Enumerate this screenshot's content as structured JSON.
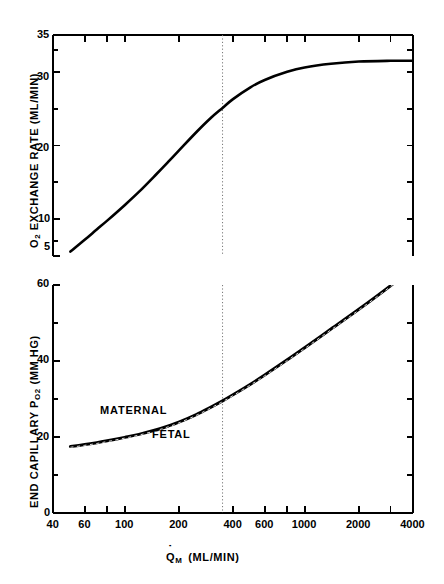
{
  "figure": {
    "background_color": "#ffffff",
    "ink_color": "#000000",
    "guide_line_color": "#777777"
  },
  "panels": {
    "top": {
      "name": "o2-exchange-rate-panel",
      "y_axis_label_parts": {
        "lead": "O",
        "sub": "2",
        "rest": " EXCHANGE RATE (ML/MIN)"
      },
      "y_axis_label": "O2 EXCHANGE RATE (ML/MIN)",
      "y_ticks_major": [
        "35",
        "30",
        "20",
        "10",
        "5"
      ],
      "y_ticks_minor": [
        33,
        25,
        15,
        7
      ],
      "y_range": [
        5,
        35
      ]
    },
    "bottom": {
      "name": "end-capillary-po2-panel",
      "y_axis_label_parts": {
        "lead": "END CAPILLARY P",
        "sub": "O2",
        "rest": " (MM HG)"
      },
      "y_axis_label": "END CAPILLARY PO2 (MM HG)",
      "y_ticks_major": [
        "60",
        "40",
        "20",
        "0"
      ],
      "y_ticks_minor": [
        50,
        30,
        10
      ],
      "y_range": [
        0,
        60
      ],
      "curve_labels": {
        "maternal": "MATERNAL",
        "fetal": "FETAL"
      }
    }
  },
  "x_axis": {
    "name": "maternal-flow-axis",
    "label_parts": {
      "symbol": "Q",
      "dot": "˙",
      "sub": "M",
      "units": "(ML/MIN)"
    },
    "label": "Q̇M (ML/MIN)",
    "scale": "log",
    "range": [
      40,
      4000
    ],
    "tick_labels": [
      "40",
      "60",
      "100",
      "200",
      "400",
      "600",
      "1000",
      "2000",
      "4000"
    ],
    "tick_values": [
      40,
      60,
      100,
      200,
      400,
      600,
      1000,
      2000,
      4000
    ],
    "minor_tick_values": [
      80,
      800,
      3000
    ]
  },
  "reference_line": {
    "name": "normal-flow-marker",
    "x_value": 350,
    "style": "dotted"
  },
  "chart_data": {
    "type": "line",
    "title": "",
    "xlabel": "Q̇M (ML/MIN)",
    "xscale": "log",
    "xlim": [
      40,
      4000
    ],
    "xticks": [
      40,
      60,
      100,
      200,
      400,
      600,
      1000,
      2000,
      4000
    ],
    "xticklabels": [
      "40",
      "60",
      "100",
      "200",
      "400",
      "600",
      "1000",
      "2000",
      "4000"
    ],
    "grid": false,
    "legend": "inline-annotations",
    "annotations": [
      {
        "text": "MATERNAL",
        "x": 150,
        "y": 26,
        "panel": "bottom",
        "position": "above-curve"
      },
      {
        "text": "FETAL",
        "x": 230,
        "y": 21,
        "panel": "bottom",
        "position": "below-curve"
      }
    ],
    "vlines": [
      {
        "x": 350,
        "style": "dotted",
        "panels": [
          "top",
          "bottom"
        ]
      }
    ],
    "panels": [
      {
        "name": "top",
        "ylabel": "O2 EXCHANGE RATE (ML/MIN)",
        "ylim": [
          5,
          35
        ],
        "yticks": [
          5,
          10,
          20,
          30,
          35
        ],
        "yticklabels": [
          "5",
          "10",
          "20",
          "30",
          "35"
        ],
        "series": [
          {
            "name": "O2 exchange rate",
            "style": "solid",
            "x": [
              50,
              60,
              70,
              80,
              100,
              120,
              150,
              175,
              200,
              250,
              300,
              350,
              400,
              500,
              600,
              800,
              1000,
              1400,
              2000,
              3000,
              4000
            ],
            "y": [
              5.6,
              7.2,
              8.6,
              9.8,
              11.9,
              13.7,
              16.1,
              17.8,
              19.3,
              21.8,
              23.7,
              25.1,
              26.3,
              27.9,
              28.9,
              30.0,
              30.6,
              31.1,
              31.4,
              31.5,
              31.5
            ]
          }
        ]
      },
      {
        "name": "bottom",
        "ylabel": "END CAPILLARY PO2 (MM HG)",
        "ylim": [
          0,
          60
        ],
        "yticks": [
          0,
          10,
          20,
          30,
          40,
          50,
          60
        ],
        "yticklabels": [
          "0",
          "",
          "20",
          "",
          "40",
          "",
          "60"
        ],
        "series": [
          {
            "name": "MATERNAL",
            "style": "solid",
            "x": [
              50,
              60,
              70,
              80,
              100,
              120,
              150,
              175,
              200,
              250,
              300,
              350,
              400,
              500,
              600,
              800,
              1000,
              1400,
              2000,
              3000,
              4000
            ],
            "y": [
              17.5,
              18.0,
              18.5,
              19.0,
              19.9,
              20.7,
              21.9,
              22.9,
              23.9,
              25.9,
              27.8,
              29.5,
              31.1,
              33.9,
              36.3,
              40.3,
              43.5,
              48.4,
              53.6,
              59.8,
              64.5
            ]
          },
          {
            "name": "FETAL",
            "style": "dashed",
            "x": [
              50,
              60,
              70,
              80,
              100,
              120,
              150,
              175,
              200,
              250,
              300,
              350,
              400,
              500,
              600,
              800,
              1000,
              1400,
              2000,
              3000,
              4000
            ],
            "y": [
              17.3,
              17.8,
              18.3,
              18.8,
              19.7,
              20.5,
              21.7,
              22.7,
              23.7,
              25.7,
              27.6,
              29.3,
              30.9,
              33.7,
              36.1,
              40.1,
              43.3,
              48.2,
              53.4,
              59.6,
              64.3
            ]
          }
        ]
      }
    ]
  }
}
